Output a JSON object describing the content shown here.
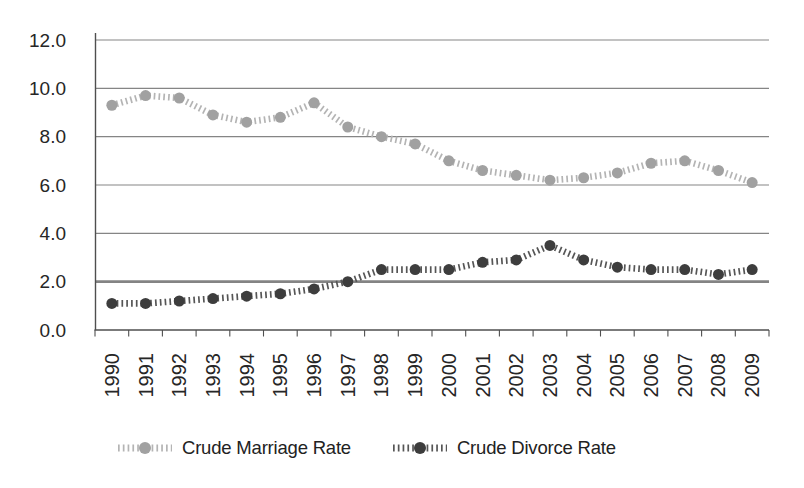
{
  "figure": {
    "background": "#ffffff",
    "text_color": "#262626"
  },
  "chart_data": {
    "type": "line",
    "categories": [
      "1990",
      "1991",
      "1992",
      "1993",
      "1994",
      "1995",
      "1996",
      "1997",
      "1998",
      "1999",
      "2000",
      "2001",
      "2002",
      "2003",
      "2004",
      "2005",
      "2006",
      "2007",
      "2008",
      "2009"
    ],
    "series": [
      {
        "name": "Crude Marriage Rate",
        "values": [
          9.3,
          9.7,
          9.6,
          8.9,
          8.6,
          8.8,
          9.4,
          8.4,
          8.0,
          7.7,
          7.0,
          6.6,
          6.4,
          6.2,
          6.3,
          6.5,
          6.9,
          7.0,
          6.6,
          6.1
        ],
        "line_color": "#b4b4b4",
        "marker_color": "#a1a1a1"
      },
      {
        "name": "Crude Divorce Rate",
        "values": [
          1.1,
          1.1,
          1.2,
          1.3,
          1.4,
          1.5,
          1.7,
          2.0,
          2.5,
          2.5,
          2.5,
          2.8,
          2.9,
          3.5,
          2.9,
          2.6,
          2.5,
          2.5,
          2.3,
          2.5
        ],
        "line_color": "#565656",
        "marker_color": "#3d3d3d"
      }
    ],
    "title": "",
    "xlabel": "",
    "ylabel": "",
    "ylim": [
      0,
      12
    ],
    "y_ticks": [
      0,
      2,
      4,
      6,
      8,
      10,
      12
    ],
    "y_tick_labels": [
      "0.0",
      "2.0",
      "4.0",
      "6.0",
      "8.0",
      "10.0",
      "12.0"
    ],
    "grid": "horizontal",
    "emphasized_gridline_value": 2,
    "gridline_color": "#858585",
    "emphasized_gridline_color": "#848484",
    "axis_color": "#4f4f4f",
    "line_style": "dotted-ticks",
    "marker": "circle",
    "legend_position": "bottom",
    "x_labels_rotation": 90
  }
}
